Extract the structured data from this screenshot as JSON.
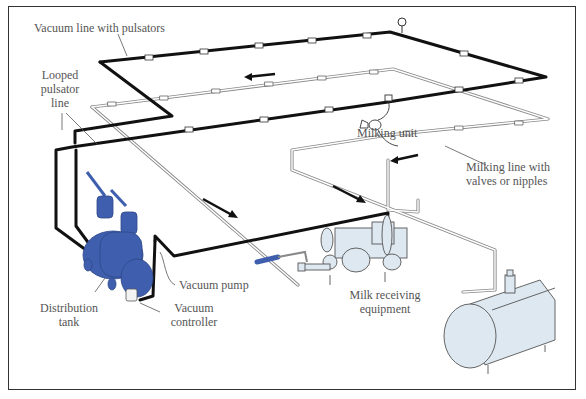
{
  "diagram": {
    "type": "milking-system-schematic",
    "colors": {
      "vacuum_line": "#111111",
      "milk_line": "#9a9a9a",
      "equipment_blue": "#3f5fae",
      "tank_fill": "#dde8f0",
      "label_text": "#555555",
      "frame": "#333333"
    },
    "labels": {
      "vacuum_line": "Vacuum line with pulsators",
      "looped_line_1": "Looped",
      "looped_line_2": "pulsator",
      "looped_line_3": "line",
      "milking_unit": "Milking unit",
      "milking_line_1": "Milking line with",
      "milking_line_2": "valves or nipples",
      "vacuum_pump": "Vacuum pump",
      "distribution_1": "Distribution",
      "distribution_2": "tank",
      "controller_1": "Vacuum",
      "controller_2": "controller",
      "receiving_1": "Milk receiving",
      "receiving_2": "equipment"
    },
    "flow_arrows": [
      {
        "direction": "left",
        "location": "upper vacuum loop"
      },
      {
        "direction": "down-right",
        "location": "toward milk receiving equipment"
      },
      {
        "direction": "down-right",
        "location": "milk line to receiver"
      },
      {
        "direction": "left",
        "location": "milking line"
      }
    ]
  }
}
